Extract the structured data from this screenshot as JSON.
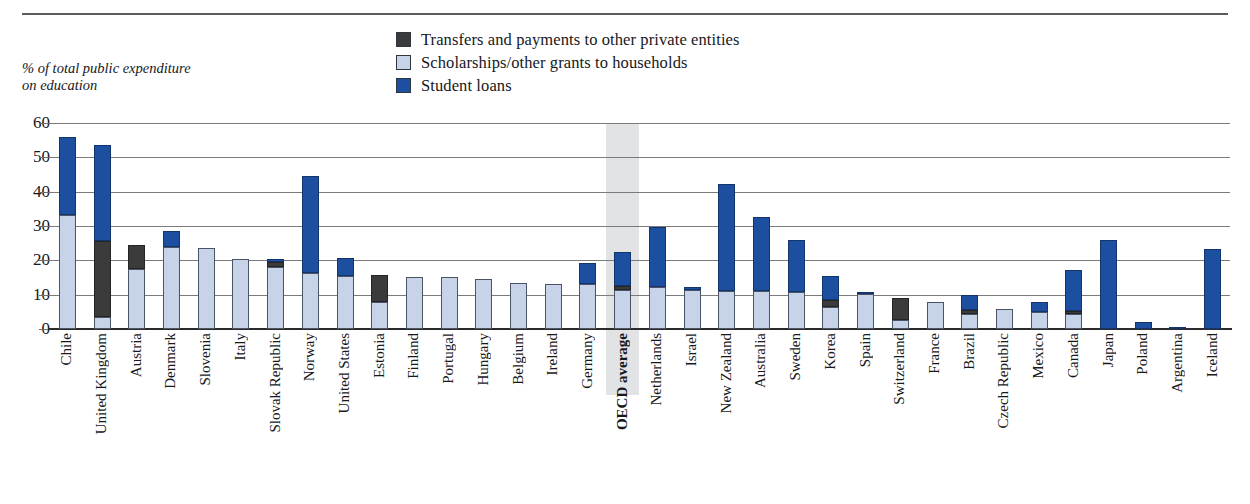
{
  "axis_title": "% of total public expenditure\non education",
  "legend": [
    {
      "id": "transfers",
      "label": "Transfers and payments to other private entities",
      "color": "#3b3b3b"
    },
    {
      "id": "scholar",
      "label": "Scholarships/other grants to households",
      "color": "#c7d3e9"
    },
    {
      "id": "loans",
      "label": "Student loans",
      "color": "#1d4fa0"
    }
  ],
  "chart_data": {
    "type": "bar",
    "stacked": true,
    "title": "",
    "subtitle": "",
    "xlabel": "",
    "ylabel": "% of total public expenditure on education",
    "ylim": [
      0,
      60
    ],
    "yticks": [
      0,
      10,
      20,
      30,
      40,
      50,
      60
    ],
    "grid": true,
    "legend_position": "top-center",
    "highlight_category": "OECD average",
    "categories": [
      "Chile",
      "United Kingdom",
      "Austria",
      "Denmark",
      "Slovenia",
      "Italy",
      "Slovak Republic",
      "Norway",
      "United States",
      "Estonia",
      "Finland",
      "Portugal",
      "Hungary",
      "Belgium",
      "Ireland",
      "Germany",
      "OECD average",
      "Netherlands",
      "Israel",
      "New Zealand",
      "Australia",
      "Sweden",
      "Korea",
      "Spain",
      "Switzerland",
      "France",
      "Brazil",
      "Czech Republic",
      "Mexico",
      "Canada",
      "Japan",
      "Poland",
      "Argentina",
      "Iceland"
    ],
    "series": [
      {
        "name": "Scholarships/other grants to households",
        "key": "scholar",
        "color": "#c7d3e9",
        "values": [
          33.2,
          3.5,
          17.5,
          24.0,
          23.5,
          20.5,
          18.0,
          16.2,
          15.5,
          8.0,
          15.2,
          15.2,
          14.7,
          13.5,
          13.2,
          13.0,
          11.5,
          12.3,
          11.5,
          11.0,
          11.0,
          10.8,
          6.5,
          10.3,
          2.5,
          8.0,
          4.5,
          5.8,
          5.0,
          4.3,
          0.0,
          0.0,
          0.0,
          0.0
        ]
      },
      {
        "name": "Transfers and payments to other private entities",
        "key": "transfers",
        "color": "#3b3b3b",
        "values": [
          0.0,
          22.0,
          7.0,
          0.0,
          0.0,
          0.0,
          1.4,
          0.0,
          0.0,
          7.7,
          0.0,
          0.0,
          0.0,
          0.0,
          0.0,
          0.0,
          1.0,
          0.0,
          0.0,
          0.0,
          0.0,
          0.0,
          2.0,
          0.0,
          6.5,
          0.0,
          1.0,
          0.0,
          0.0,
          1.0,
          0.0,
          0.0,
          0.0,
          0.0
        ]
      },
      {
        "name": "Student loans",
        "key": "loans",
        "color": "#1d4fa0",
        "values": [
          22.6,
          28.0,
          0.0,
          4.5,
          0.0,
          0.0,
          0.9,
          28.3,
          5.2,
          0.0,
          0.0,
          0.0,
          0.0,
          0.0,
          0.0,
          6.3,
          9.8,
          17.5,
          0.7,
          31.3,
          21.5,
          15.2,
          7.0,
          0.5,
          0.0,
          0.0,
          4.5,
          0.0,
          3.0,
          12.0,
          26.0,
          2.0,
          0.6,
          23.3
        ]
      }
    ],
    "totals": [
      55.8,
      53.5,
      24.5,
      28.5,
      23.5,
      20.5,
      20.3,
      44.5,
      20.7,
      15.7,
      15.2,
      15.2,
      14.7,
      13.5,
      13.2,
      19.3,
      22.3,
      29.8,
      12.2,
      42.3,
      32.5,
      26.0,
      15.5,
      10.8,
      9.0,
      8.0,
      10.0,
      5.8,
      8.0,
      17.3,
      26.0,
      2.0,
      0.6,
      23.3
    ]
  }
}
